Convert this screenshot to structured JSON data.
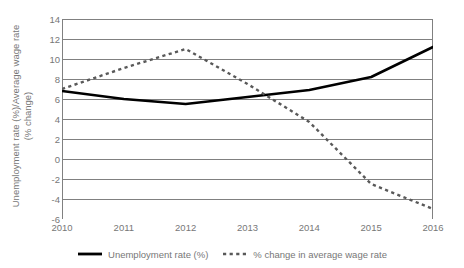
{
  "chart_data": {
    "type": "line",
    "title": "",
    "xlabel": "",
    "ylabel": "Unemployment rate (%)/Average wage rate (% change)",
    "ylabel_lines": [
      "Unemployment rate (%)/Average wage rate",
      "(% change)"
    ],
    "categories": [
      "2010",
      "2011",
      "2012",
      "2013",
      "2014",
      "2015",
      "2016"
    ],
    "x": [
      2010,
      2011,
      2012,
      2013,
      2014,
      2015,
      2016
    ],
    "xlim": [
      2010,
      2016
    ],
    "ylim": [
      -6,
      14
    ],
    "yticks": [
      -6,
      -4,
      -2,
      0,
      2,
      4,
      6,
      8,
      10,
      12,
      14
    ],
    "ytick_labels": [
      "-6",
      "-4",
      "-2",
      "0",
      "2",
      "4",
      "6",
      "8",
      "10",
      "12",
      "14"
    ],
    "grid": true,
    "grid_axis": "y",
    "legend_position": "bottom",
    "series": [
      {
        "name": "Unemployment rate (%)",
        "style": "solid",
        "color": "#000000",
        "width": 2.6,
        "values": [
          6.8,
          6.0,
          5.5,
          6.2,
          6.9,
          8.2,
          11.2
        ]
      },
      {
        "name": "% change in average wage rate",
        "style": "dashed",
        "color": "#595959",
        "width": 2.4,
        "values": [
          7.0,
          9.1,
          11.0,
          7.5,
          3.7,
          -2.5,
          -5.0
        ]
      }
    ]
  },
  "legend": {
    "entries": [
      {
        "label": "Unemployment rate (%)",
        "marker": "solid-line-swatch"
      },
      {
        "label": "% change in average wage rate",
        "marker": "dashed-line-swatch"
      }
    ]
  },
  "colors": {
    "background": "#ffffff",
    "gridline": "#808080",
    "axis": "#808080",
    "text": "#777777",
    "series_solid": "#000000",
    "series_dashed": "#595959"
  }
}
